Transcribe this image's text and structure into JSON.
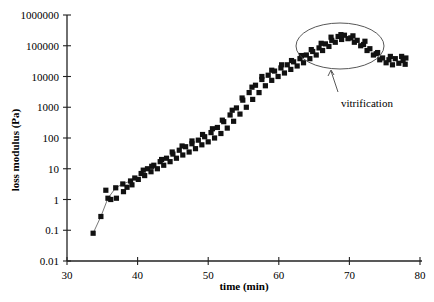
{
  "chart_data": {
    "type": "scatter",
    "title": "",
    "xlabel": "time (min)",
    "ylabel": "loss modulus (Pa)",
    "xlim": [
      30,
      80
    ],
    "ylim": [
      0.01,
      1000000
    ],
    "yscale": "log",
    "grid": false,
    "legend": null,
    "x_ticks": [
      "30",
      "40",
      "50",
      "60",
      "70",
      "80"
    ],
    "y_ticks": [
      "0.01",
      "0.1",
      "1",
      "10",
      "100",
      "1000",
      "10000",
      "100000",
      "1000000"
    ],
    "annotations": [
      {
        "text": "vitrification",
        "type": "ellipse-with-arrow",
        "ellipse_center": [
          68,
          230000
        ],
        "label_position": [
          69,
          10000
        ]
      }
    ],
    "series": [
      {
        "name": "early (connected)",
        "marker": "filled-square",
        "line": true,
        "points": [
          [
            33.7,
            0.08
          ],
          [
            34.8,
            0.28
          ],
          [
            35.8,
            1.1
          ],
          [
            36.9,
            2.4
          ],
          [
            37.9,
            3.2
          ],
          [
            39.0,
            4.0
          ]
        ]
      },
      {
        "name": "run A",
        "marker": "filled-square",
        "line": false,
        "points": [
          [
            35.5,
            2.0
          ],
          [
            37.0,
            1.1
          ],
          [
            38.5,
            2.5
          ],
          [
            39.6,
            5
          ],
          [
            40.5,
            7
          ],
          [
            41.4,
            10
          ],
          [
            42.3,
            13
          ],
          [
            43.2,
            17
          ],
          [
            44.1,
            22
          ],
          [
            45.0,
            30
          ],
          [
            45.9,
            40
          ],
          [
            46.8,
            52
          ],
          [
            47.7,
            65
          ],
          [
            48.6,
            85
          ],
          [
            49.5,
            110
          ],
          [
            50.4,
            150
          ],
          [
            51.3,
            220
          ],
          [
            52.2,
            340
          ],
          [
            53.1,
            560
          ],
          [
            54.0,
            950
          ],
          [
            54.9,
            1700
          ],
          [
            55.8,
            3000
          ],
          [
            56.7,
            5200
          ],
          [
            57.6,
            8000
          ],
          [
            58.5,
            11000
          ],
          [
            59.4,
            15000
          ],
          [
            60.3,
            19000
          ],
          [
            61.2,
            24000
          ],
          [
            62.1,
            30000
          ],
          [
            63.0,
            38000
          ],
          [
            63.9,
            50000
          ],
          [
            64.8,
            65000
          ],
          [
            65.7,
            85000
          ],
          [
            66.6,
            115000
          ],
          [
            67.5,
            150000
          ],
          [
            68.4,
            200000
          ],
          [
            69.3,
            220000
          ],
          [
            70.2,
            180000
          ],
          [
            71.1,
            150000
          ],
          [
            72.0,
            110000
          ],
          [
            72.9,
            80000
          ],
          [
            73.8,
            55000
          ],
          [
            74.7,
            40000
          ],
          [
            75.6,
            35000
          ],
          [
            76.5,
            38000
          ],
          [
            77.4,
            45000
          ],
          [
            78.0,
            40000
          ]
        ]
      },
      {
        "name": "run B",
        "marker": "filled-square",
        "line": false,
        "points": [
          [
            36.2,
            1.0
          ],
          [
            38.0,
            1.8
          ],
          [
            39.2,
            3.0
          ],
          [
            40.1,
            4.5
          ],
          [
            41.0,
            6
          ],
          [
            41.9,
            8
          ],
          [
            42.8,
            10
          ],
          [
            43.7,
            13
          ],
          [
            44.6,
            17
          ],
          [
            45.5,
            22
          ],
          [
            46.4,
            28
          ],
          [
            47.3,
            35
          ],
          [
            48.2,
            45
          ],
          [
            49.1,
            60
          ],
          [
            50.0,
            75
          ],
          [
            50.9,
            100
          ],
          [
            51.8,
            140
          ],
          [
            52.7,
            210
          ],
          [
            53.6,
            350
          ],
          [
            54.5,
            600
          ],
          [
            55.4,
            1000
          ],
          [
            56.3,
            1800
          ],
          [
            57.2,
            3000
          ],
          [
            58.1,
            5000
          ],
          [
            59.0,
            7500
          ],
          [
            59.9,
            10000
          ],
          [
            60.8,
            13000
          ],
          [
            61.7,
            17000
          ],
          [
            62.6,
            22000
          ],
          [
            63.5,
            28000
          ],
          [
            64.4,
            38000
          ],
          [
            65.3,
            50000
          ],
          [
            66.2,
            70000
          ],
          [
            67.1,
            95000
          ],
          [
            68.0,
            130000
          ],
          [
            68.9,
            160000
          ],
          [
            69.8,
            170000
          ],
          [
            70.7,
            130000
          ],
          [
            71.6,
            100000
          ],
          [
            72.5,
            70000
          ],
          [
            73.4,
            50000
          ],
          [
            74.3,
            35000
          ],
          [
            75.2,
            28000
          ],
          [
            76.1,
            24000
          ],
          [
            77.0,
            27000
          ],
          [
            77.9,
            25000
          ]
        ]
      },
      {
        "name": "run C",
        "marker": "filled-square",
        "line": false,
        "points": [
          [
            40.8,
            9
          ],
          [
            42.0,
            12
          ],
          [
            43.4,
            20
          ],
          [
            44.9,
            35
          ],
          [
            46.3,
            55
          ],
          [
            47.7,
            80
          ],
          [
            49.2,
            130
          ],
          [
            50.6,
            200
          ],
          [
            52.0,
            380
          ],
          [
            53.4,
            800
          ],
          [
            54.8,
            2000
          ],
          [
            56.2,
            4500
          ],
          [
            57.6,
            10000
          ],
          [
            59.0,
            16000
          ],
          [
            60.4,
            24000
          ],
          [
            61.8,
            33000
          ],
          [
            63.2,
            48000
          ],
          [
            64.6,
            75000
          ],
          [
            66.0,
            120000
          ],
          [
            67.4,
            190000
          ],
          [
            68.8,
            230000
          ],
          [
            70.5,
            210000
          ],
          [
            72.2,
            140000
          ],
          [
            74.0,
            60000
          ],
          [
            75.8,
            45000
          ],
          [
            77.6,
            33000
          ]
        ]
      }
    ]
  },
  "labels": {
    "xlabel": "time (min)",
    "ylabel": "loss modulus (Pa)",
    "annotation": "vitrification"
  }
}
